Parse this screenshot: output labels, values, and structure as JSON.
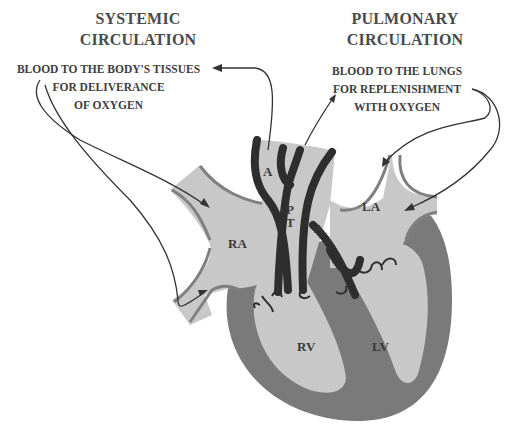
{
  "titles": {
    "systemic": {
      "line1": "SYSTEMIC",
      "line2": "CIRCULATION"
    },
    "pulmonary": {
      "line1": "PULMONARY",
      "line2": "CIRCULATION"
    }
  },
  "captions": {
    "systemic": {
      "line1": "BLOOD TO THE BODY'S TISSUES",
      "line2": "FOR DELIVERANCE",
      "line3": "OF OXYGEN"
    },
    "pulmonary": {
      "line1": "BLOOD TO THE LUNGS",
      "line2": "FOR REPLENISHMENT",
      "line3": "WITH OXYGEN"
    }
  },
  "chambers": {
    "ra": "RA",
    "la": "LA",
    "rv": "RV",
    "lv": "LV"
  },
  "vessels": {
    "aorta": "A",
    "pulmonary_trunk_p": "P",
    "pulmonary_trunk_t": "T",
    "pulmonary_artery": "A"
  },
  "colors": {
    "chamber_fill": "#c8c8c8",
    "myocardium": "#7a7a7a",
    "vessel_wall": "#2e2e2e",
    "vein_edge": "#808080",
    "arrow": "#333333",
    "text": "#3e3e3e"
  }
}
